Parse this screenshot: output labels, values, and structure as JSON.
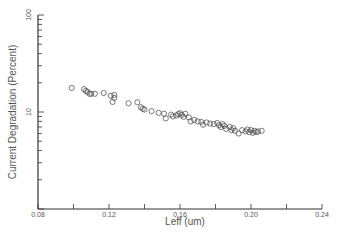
{
  "chart_data": {
    "type": "scatter",
    "title": "",
    "xlabel": "Leff (um)",
    "ylabel": "Current Degradation (Percent)",
    "xlim": [
      0.08,
      0.24
    ],
    "ylim": [
      1,
      100
    ],
    "yscale": "log",
    "grid": false,
    "legend": null,
    "x_ticks": [
      0.08,
      0.1,
      0.12,
      0.14,
      0.16,
      0.18,
      0.2,
      0.22,
      0.24
    ],
    "x_tick_labels": [
      "0.08",
      "",
      "0.12",
      "",
      "0.16",
      "",
      "0.20",
      "",
      "0.24"
    ],
    "y_tick_labels": [
      {
        "value": 1,
        "label": ""
      },
      {
        "value": 10,
        "label": "10"
      },
      {
        "value": 100,
        "label": "100"
      }
    ],
    "marker": "open-circle",
    "series": [
      {
        "name": "Current Degradation",
        "points": [
          [
            0.099,
            17.7
          ],
          [
            0.106,
            17.2
          ],
          [
            0.107,
            16.5
          ],
          [
            0.108,
            16.1
          ],
          [
            0.109,
            15.4
          ],
          [
            0.11,
            15.4
          ],
          [
            0.112,
            15.4
          ],
          [
            0.117,
            15.7
          ],
          [
            0.121,
            14.7
          ],
          [
            0.123,
            15.0
          ],
          [
            0.123,
            14.0
          ],
          [
            0.122,
            12.7
          ],
          [
            0.131,
            12.3
          ],
          [
            0.136,
            12.6
          ],
          [
            0.138,
            11.2
          ],
          [
            0.139,
            10.8
          ],
          [
            0.14,
            10.6
          ],
          [
            0.144,
            10.2
          ],
          [
            0.148,
            9.8
          ],
          [
            0.151,
            9.6
          ],
          [
            0.152,
            8.6
          ],
          [
            0.155,
            9.4
          ],
          [
            0.156,
            9.0
          ],
          [
            0.158,
            9.2
          ],
          [
            0.159,
            9.5
          ],
          [
            0.16,
            9.7
          ],
          [
            0.161,
            9.3
          ],
          [
            0.162,
            8.9
          ],
          [
            0.163,
            9.6
          ],
          [
            0.165,
            8.8
          ],
          [
            0.166,
            8.0
          ],
          [
            0.168,
            8.3
          ],
          [
            0.17,
            8.0
          ],
          [
            0.172,
            7.9
          ],
          [
            0.173,
            7.4
          ],
          [
            0.175,
            7.8
          ],
          [
            0.177,
            7.6
          ],
          [
            0.179,
            7.5
          ],
          [
            0.181,
            7.7
          ],
          [
            0.182,
            7.3
          ],
          [
            0.183,
            7.0
          ],
          [
            0.184,
            7.5
          ],
          [
            0.185,
            7.2
          ],
          [
            0.186,
            6.7
          ],
          [
            0.188,
            7.0
          ],
          [
            0.189,
            6.5
          ],
          [
            0.19,
            6.8
          ],
          [
            0.191,
            6.4
          ],
          [
            0.193,
            6.0
          ],
          [
            0.195,
            6.5
          ],
          [
            0.197,
            6.3
          ],
          [
            0.198,
            6.6
          ],
          [
            0.199,
            6.2
          ],
          [
            0.2,
            6.5
          ],
          [
            0.201,
            6.1
          ],
          [
            0.202,
            6.4
          ],
          [
            0.203,
            6.2
          ],
          [
            0.204,
            6.3
          ],
          [
            0.206,
            6.4
          ]
        ]
      }
    ]
  }
}
